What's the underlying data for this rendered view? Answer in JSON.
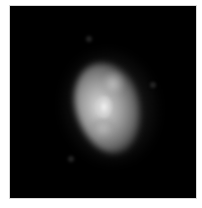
{
  "image": {
    "description": "Grayscale image of a diffuse bright blob centered on a black background, framed by a thin light border",
    "background_color": "#000000",
    "frame_color": "#d8d8d8",
    "blob": {
      "brightest_color": "#f0f0f0",
      "mid_color": "#9a9a9a",
      "edge_color": "#333333"
    }
  }
}
